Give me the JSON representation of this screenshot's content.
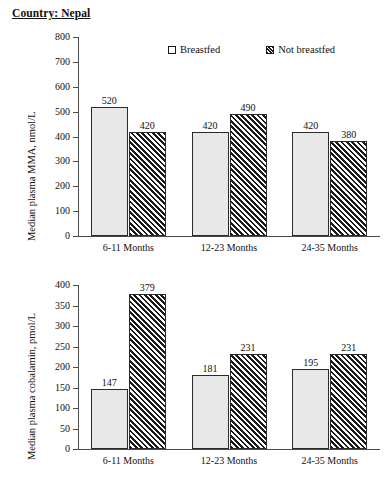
{
  "figure": {
    "title": "Country: Nepal"
  },
  "legend": {
    "position": "top-center",
    "items": [
      {
        "label": "Breastfed",
        "swatch": "solid-light-square"
      },
      {
        "label": "Not breastfed",
        "swatch": "diagonal-hatch-square"
      }
    ]
  },
  "chart_data": [
    {
      "id": "mma",
      "type": "bar",
      "title": "Country: Nepal",
      "xlabel": "",
      "ylabel": "Median plasma MMA, nmol/L",
      "ylim": [
        0,
        800
      ],
      "ytick_step": 100,
      "yticks": [
        0,
        100,
        200,
        300,
        400,
        500,
        600,
        700,
        800
      ],
      "ytick_labels": [
        "0",
        "100",
        "200",
        "300",
        "400",
        "500",
        "600",
        "700",
        "800"
      ],
      "grid": false,
      "categories": [
        "6-11 Months",
        "12-23 Months",
        "24-35 Months"
      ],
      "series": [
        {
          "name": "Breastfed",
          "values": [
            520,
            420,
            420
          ]
        },
        {
          "name": "Not breastfed",
          "values": [
            420,
            490,
            380
          ]
        }
      ],
      "data_labels": [
        [
          "520",
          "420"
        ],
        [
          "420",
          "490"
        ],
        [
          "420",
          "380"
        ]
      ]
    },
    {
      "id": "cobalamin",
      "type": "bar",
      "title": "",
      "xlabel": "",
      "ylabel": "Median plasma cobalamin, pmol/L",
      "ylim": [
        0,
        400
      ],
      "ytick_step": 50,
      "yticks": [
        0,
        50,
        100,
        150,
        200,
        250,
        300,
        350,
        400
      ],
      "ytick_labels": [
        "0",
        "50",
        "100",
        "150",
        "200",
        "250",
        "300",
        "350",
        "400"
      ],
      "grid": false,
      "categories": [
        "6-11 Months",
        "12-23 Months",
        "24-35 Months"
      ],
      "series": [
        {
          "name": "Breastfed",
          "values": [
            147,
            181,
            195
          ]
        },
        {
          "name": "Not breastfed",
          "values": [
            379,
            231,
            231
          ]
        }
      ],
      "data_labels": [
        [
          "147",
          "379"
        ],
        [
          "181",
          "231"
        ],
        [
          "195",
          "231"
        ]
      ]
    }
  ],
  "colors": {
    "breastfed_fill": "#e8e8e8",
    "not_breastfed_fill": "#ffffff",
    "hatch_line": "#1a1a1a",
    "bar_border": "#2b2b2b",
    "axis": "#4a4a4a",
    "text": "#111111"
  }
}
